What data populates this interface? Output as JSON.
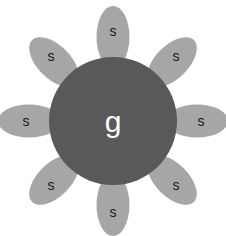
{
  "figure": {
    "canvas": {
      "width": 226,
      "height": 236,
      "background": "#ffffff"
    },
    "core": {
      "name": "glycogenin-core",
      "label": "g",
      "label_color": "#ffffff",
      "fill": "#595959",
      "cx": 113,
      "cy": 121,
      "r": 64
    },
    "satellite_shape": {
      "fill": "#a6a6a6",
      "rx": 16.5,
      "ry": 31,
      "label_color": "#1a1a1a"
    },
    "satellites": [
      {
        "name": "satellite-n",
        "label": "s",
        "cx": 113,
        "cy": 37,
        "rotate": 0,
        "label_x": 113,
        "label_y": 31
      },
      {
        "name": "satellite-ne",
        "label": "s",
        "cx": 172,
        "cy": 62,
        "rotate": 45,
        "label_x": 176,
        "label_y": 56
      },
      {
        "name": "satellite-e",
        "label": "s",
        "cx": 197,
        "cy": 121,
        "rotate": 90,
        "label_x": 201,
        "label_y": 121
      },
      {
        "name": "satellite-se",
        "label": "s",
        "cx": 172,
        "cy": 180,
        "rotate": 135,
        "label_x": 176,
        "label_y": 185
      },
      {
        "name": "satellite-s",
        "label": "s",
        "cx": 113,
        "cy": 205,
        "rotate": 180,
        "label_x": 113,
        "label_y": 212
      },
      {
        "name": "satellite-sw",
        "label": "s",
        "cx": 54,
        "cy": 180,
        "rotate": 225,
        "label_x": 51,
        "label_y": 185
      },
      {
        "name": "satellite-w",
        "label": "s",
        "cx": 29,
        "cy": 121,
        "rotate": 270,
        "label_x": 26,
        "label_y": 121
      },
      {
        "name": "satellite-nw",
        "label": "s",
        "cx": 54,
        "cy": 62,
        "rotate": 315,
        "label_x": 51,
        "label_y": 56
      }
    ]
  }
}
